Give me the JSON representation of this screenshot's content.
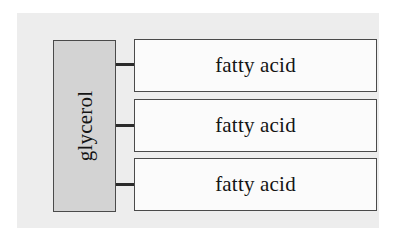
{
  "diagram": {
    "colors": {
      "panel_background": "#ededed",
      "glycerol_fill": "#d3d3d3",
      "fatty_acid_fill": "#fbfbfb",
      "border": "#4a4a4a",
      "connector": "#2b2b2b",
      "text": "#141414",
      "page_background": "#ffffff"
    },
    "glycerol": {
      "label": "glycerol",
      "orientation": "vertical-bottom-to-top"
    },
    "fatty_acids": [
      {
        "label": "fatty acid"
      },
      {
        "label": "fatty acid"
      },
      {
        "label": "fatty acid"
      }
    ],
    "connectors": [
      {
        "name": "glycerol-to-fatty-acid-1"
      },
      {
        "name": "glycerol-to-fatty-acid-2"
      },
      {
        "name": "glycerol-to-fatty-acid-3"
      }
    ]
  }
}
